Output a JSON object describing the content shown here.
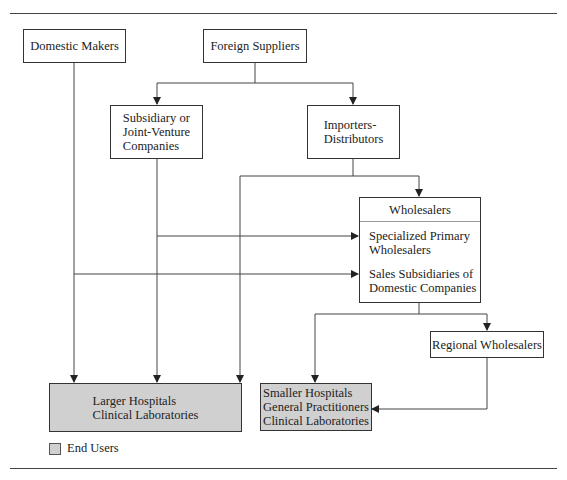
{
  "diagram": {
    "nodes": {
      "domestic_makers": "Domestic Makers",
      "foreign_suppliers": "Foreign Suppliers",
      "subsidiary": "Subsidiary or\nJoint-Venture\nCompanies",
      "importers": "Importers-\nDistributors",
      "wholesalers": {
        "title": "Wholesalers",
        "items": [
          "Specialized Primary\nWholesalers",
          "Sales Subsidiaries of\nDomestic Companies"
        ]
      },
      "regional_wholesalers": "Regional Wholesalers",
      "larger_hospitals": "Larger Hospitals\nClinical Laboratories",
      "smaller_hospitals": "Smaller Hospitals\nGeneral Practitioners\nClinical Laboratories"
    },
    "edges": [
      [
        "Foreign Suppliers",
        "Subsidiary or Joint-Venture Companies"
      ],
      [
        "Foreign Suppliers",
        "Importers-Distributors"
      ],
      [
        "Importers-Distributors",
        "Wholesalers"
      ],
      [
        "Importers-Distributors",
        "Larger Hospitals / Clinical Laboratories"
      ],
      [
        "Subsidiary or Joint-Venture Companies",
        "Specialized Primary Wholesalers"
      ],
      [
        "Subsidiary or Joint-Venture Companies",
        "Larger Hospitals / Clinical Laboratories"
      ],
      [
        "Domestic Makers",
        "Sales Subsidiaries of Domestic Companies"
      ],
      [
        "Domestic Makers",
        "Larger Hospitals / Clinical Laboratories"
      ],
      [
        "Wholesalers",
        "Smaller Hospitals / General Practitioners / Clinical Laboratories"
      ],
      [
        "Wholesalers",
        "Regional Wholesalers"
      ],
      [
        "Regional Wholesalers",
        "Smaller Hospitals / General Practitioners / Clinical Laboratories"
      ]
    ],
    "legend": {
      "label": "End Users",
      "color": "#d0d0d0"
    }
  }
}
